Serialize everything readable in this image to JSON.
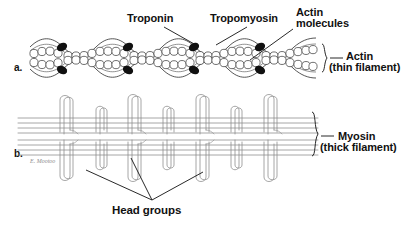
{
  "figure": {
    "background_color": "#ffffff",
    "ink_color": "#111111",
    "thin_line_color": "#6b6b6b",
    "troponin_color": "#101010"
  },
  "panels": [
    {
      "id": "a",
      "letter": "a.",
      "subject": "actin thin filament"
    },
    {
      "id": "b",
      "letter": "b.",
      "subject": "myosin thick filament"
    }
  ],
  "labels": {
    "troponin": "Troponin",
    "tropomyosin": "Tropomyosin",
    "actin_molecules_line1": "Actin",
    "actin_molecules_line2": "molecules",
    "actin_filament_line1": "Actin",
    "actin_filament_line2": "(thin filament)",
    "myosin_filament_line1": "Myosin",
    "myosin_filament_line2": "(thick filament)",
    "head_groups": "Head groups",
    "signature": "E. Mootoo"
  },
  "diagram_data": {
    "type": "biological-schematic",
    "panel_a": {
      "name": "Actin (thin filament)",
      "description": "Two helically intertwined strands of globular actin molecules wrapped by tropomyosin strands with troponin complexes",
      "actin_bead_count": 56,
      "troponin_complex_count": 8,
      "troponin_pair_positions_x": [
        62,
        128,
        194,
        260
      ],
      "helix_crossover_count": 4,
      "helix_period_px": 66,
      "helix_start_x": 30,
      "helix_end_x": 318,
      "axis_y": 58,
      "helix_amplitude_px": 11
    },
    "panel_b": {
      "name": "Myosin (thick filament)",
      "description": "Bundled myosin tail rods running horizontally with projecting hook shaped head groups above and below",
      "backbone_line_count": 8,
      "head_group_count_upper": 10,
      "head_group_count_lower": 10,
      "upper_head_x_positions": [
        62,
        88,
        108,
        134,
        158,
        184,
        206,
        232,
        254,
        280
      ],
      "lower_head_x_positions": [
        62,
        88,
        108,
        134,
        158,
        184,
        206,
        232,
        254,
        280
      ],
      "filament_left_x": 18,
      "filament_right_x": 318,
      "axis_y": 130
    },
    "leader_lines": [
      {
        "from_label": "Troponin",
        "to_feature": "troponin complex",
        "from": [
          170,
          26
        ],
        "to": [
          198,
          46
        ]
      },
      {
        "from_label": "Tropomyosin",
        "to_feature": "tropomyosin strand",
        "from": [
          252,
          26
        ],
        "to": [
          215,
          46
        ]
      },
      {
        "from_label": "Actin molecules",
        "to_feature": "actin bead",
        "from": [
          293,
          30
        ],
        "to": [
          252,
          60
        ]
      },
      {
        "from_label": "Head groups",
        "to_feature": "upper myosin head",
        "from": [
          152,
          200
        ],
        "to": [
          92,
          168
        ]
      },
      {
        "from_label": "Head groups",
        "to_feature": "lower myosin head",
        "from": [
          152,
          200
        ],
        "to": [
          133,
          158
        ]
      },
      {
        "from_label": "Head groups",
        "to_feature": "lower myosin head right",
        "from": [
          152,
          200
        ],
        "to": [
          205,
          170
        ]
      }
    ],
    "brackets": [
      {
        "label": "Actin (thin filament)",
        "x": 322,
        "y": 58,
        "height": 26
      },
      {
        "label": "Myosin (thick filament)",
        "x": 314,
        "y": 132,
        "height": 44
      }
    ]
  }
}
